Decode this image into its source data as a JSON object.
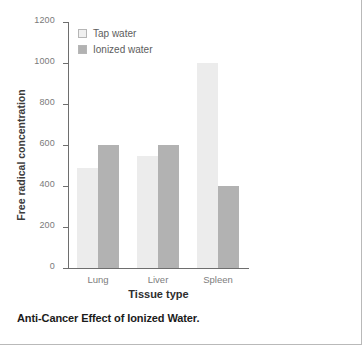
{
  "caption": "Anti-Cancer Effect of Ionized Water.",
  "legend": {
    "items": [
      {
        "label": "Tap water",
        "color": "#ececec",
        "swatch_icon": "legend-swatch-icon"
      },
      {
        "label": "Ionized water",
        "color": "#b2b2b2",
        "swatch_icon": "legend-swatch-icon"
      }
    ]
  },
  "chart_data": {
    "type": "bar",
    "title": "Anti-Cancer Effect of Ionized Water.",
    "xlabel": "Tissue type",
    "ylabel": "Free radical concentration",
    "categories": [
      "Lung",
      "Liver",
      "Spleen"
    ],
    "series": [
      {
        "name": "Tap water",
        "color": "#ececec",
        "values": [
          490,
          545,
          1000
        ]
      },
      {
        "name": "Ionized water",
        "color": "#b2b2b2",
        "values": [
          600,
          600,
          400
        ]
      }
    ],
    "ylim": [
      0,
      1200
    ],
    "yticks": [
      0,
      200,
      400,
      600,
      800,
      1000,
      1200
    ],
    "ytick_labels": [
      "0",
      "200",
      "400",
      "600",
      "800",
      "1000",
      "1200"
    ],
    "grid": false,
    "legend_position": "top-left-inside",
    "axis_color": "#6e6e6e"
  }
}
